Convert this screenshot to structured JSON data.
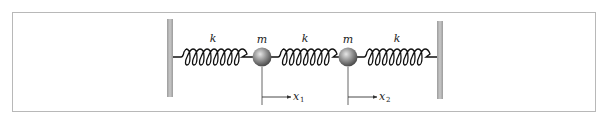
{
  "diagram": {
    "colors": {
      "frame": "#b8b8b8",
      "wall": "#b0b0b0",
      "spring": "#111111",
      "mass": "#8a8a8a",
      "line": "#555555"
    },
    "walls": [
      {
        "id": "left-wall",
        "label": ""
      },
      {
        "id": "right-wall",
        "label": ""
      }
    ],
    "springs": [
      {
        "id": "spring-1",
        "label": "k"
      },
      {
        "id": "spring-2",
        "label": "k"
      },
      {
        "id": "spring-3",
        "label": "k"
      }
    ],
    "masses": [
      {
        "id": "mass-1",
        "label": "m",
        "displacement": "x",
        "displacement_sub": "1"
      },
      {
        "id": "mass-2",
        "label": "m",
        "displacement": "x",
        "displacement_sub": "2"
      }
    ]
  }
}
